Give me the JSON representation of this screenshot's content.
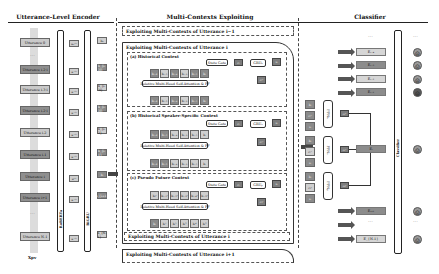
{
  "sections": {
    "encoder": "Utterance-Level Encoder",
    "exploiting": "Multi-Contexts Exploiting",
    "classifier": "Classifier"
  },
  "encoder": {
    "utterances": [
      {
        "label": "Utterance 0",
        "shade": "light"
      },
      {
        "label": "Utterance i-2·l",
        "shade": "dark"
      },
      {
        "label": "Utterance i-3·l",
        "shade": "light"
      },
      {
        "label": "Utterance i-2·l",
        "shade": "dark"
      },
      {
        "label": "Utterance i-2",
        "shade": "light"
      },
      {
        "label": "Utterance i-1",
        "shade": "dark"
      },
      {
        "label": "Utterance i",
        "shade": "dark"
      },
      {
        "label": "Utterance i+1",
        "shade": "dark"
      },
      {
        "label": "Utterance N-1",
        "shade": "light"
      }
    ],
    "column1_label": "RoBERTa",
    "column2_label": "BiGRU",
    "mid_tokens": [
      "u₀ᶜˡˢ",
      "u ᶜˡˢ",
      "u ᶜˡˢ",
      "u ᶜˡˢ",
      "u ᶜˡˢ",
      "u ᶜˡˢ",
      "uᶜˡˢ",
      "u ᶜˡˢ",
      "u ᶜˡˢ"
    ],
    "out_tokens": [
      "h₀",
      "h_{i-2l}",
      "h_{i-3l}",
      "h_{i-2l}",
      "h_{i-2}",
      "h_{i-1}",
      "hᵢ",
      "h_{i+1}",
      "h_{N-1}"
    ],
    "bottom_label": "Xpv"
  },
  "exploiting": {
    "prev": "Exploiting Multi-Contexts of Utterance i−1",
    "current": "Exploiting Multi-Contexts of Utterance i",
    "current_bottom": "Exploiting Multi-Contexts of Utterance i",
    "next": "Exploiting Multi-Contexts of Utterance i+1",
    "blocks": [
      {
        "title": "(a) Historical Context",
        "state_gate": "State Gate",
        "gru": "GRUₕ",
        "attn": "Relative Multi-Head Self-Attention & FF",
        "c_label": "cᵢʰ",
        "top_tokens": [
          "hᵢ₋₆",
          "hᵢ₋₅",
          "hᵢ₋₄",
          "hᵢ₋₃",
          "hᵢ₋₂",
          "hᵢ"
        ],
        "bottom_tokens": [
          "hᵢ₋₆",
          "hᵢ₋₅",
          "hᵢ₋₄",
          "hᵢ₋₃",
          "hᵢ₋₂",
          "hᵢ"
        ]
      },
      {
        "title": "(b) Historical Speaker-Specific Context",
        "state_gate": "State Gate",
        "gru": "GRUₛ",
        "attn": "Relative Multi-Head Self-Attention & FF",
        "c_label": "cᵢˢ",
        "top_tokens": [
          "hᵢ₋₆",
          "hᵢ₋₅",
          "hᵢ₋₄",
          "hᵢ₋₃",
          "hᵢ₋₂",
          "hᵢ"
        ],
        "bottom_tokens": [
          "hᵢ₋₆",
          "hᵢ₋₅",
          "hᵢ₋₄",
          "hᵢ₋₃",
          "hᵢ₋₂",
          "hᵢ"
        ]
      },
      {
        "title": "(c) Pseudo Future Context",
        "state_gate": "State Gate",
        "gru": "GRUₚ",
        "attn": "Relative Multi-Head Self-Attention & FF",
        "c_label": "cᵢᵖ",
        "top_tokens": [
          "hᵢᵖ",
          "hᵢ₊₁ᵖ",
          "hᵢ₊₂ᵖ",
          "hᵢ₊₃ᵖ",
          "hᵢ₊₄ᵖ",
          "hᵢ₊₅ᵖ"
        ],
        "bottom_tokens": [
          "hᵢ",
          "hᵢ¹",
          "hᵢ²",
          "hᵢ³",
          "hᵢ⁴",
          "hᵢ⁵"
        ]
      }
    ]
  },
  "classifier": {
    "ffn_labels": [
      "FFNₕ",
      "FFNₛ",
      "FFNₚ"
    ],
    "ffn_inputs": [
      [
        "hᵢ",
        "cᵢʰ",
        "sᵢ"
      ],
      [
        "hᵢ",
        "cᵢˢ",
        "sᵢ"
      ],
      [
        "hᵢ",
        "cᵢᵖ",
        "sᵢ"
      ]
    ],
    "ffn_outputs": [
      "oᵢʰ",
      "oᵢˢ",
      "oᵢᵖ"
    ],
    "column_label": "Classifier",
    "emotion_rows": [
      {
        "label": "Eᵢ₋₄",
        "shade": "light"
      },
      {
        "label": "Eᵢ₋₃",
        "shade": "dark"
      },
      {
        "label": "Eᵢ₋₂",
        "shade": "light"
      },
      {
        "label": "Eᵢ₋₁",
        "shade": "dark"
      },
      {
        "label": "Eᵢ",
        "shade": "dark"
      },
      {
        "label": "Eᵢ₊₁",
        "shade": "dark"
      },
      {
        "label": "E_{N-1}",
        "shade": "light"
      }
    ],
    "emojis": [
      "☹",
      "☺",
      "☹",
      "☹",
      "☺",
      "☺",
      "☺"
    ]
  }
}
